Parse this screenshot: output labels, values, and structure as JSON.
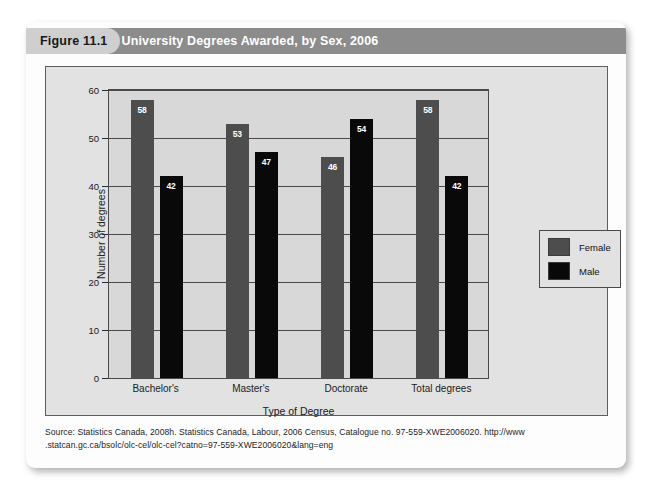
{
  "figure": {
    "number_label": "Figure 11.1",
    "title": "University Degrees Awarded, by Sex, 2006",
    "source_line_1": "Source: Statistics Canada, 2008h. Statistics Canada, Labour, 2006 Census, Catalogue no. 97-559-XWE2006020. http://www",
    "source_line_2": ".statcan.gc.ca/bsolc/olc-cel/olc-cel?catno=97-559-XWE2006020&lang=eng"
  },
  "colors": {
    "female": "#4d4d4d",
    "male": "#090909",
    "title_bar": "#8c8c8c",
    "number_tab": "#cfcfcf",
    "plot_background": "#d8d8d8",
    "panel_background": "#e2e2e2"
  },
  "chart_data": {
    "type": "bar",
    "title": "University Degrees Awarded, by Sex, 2006",
    "xlabel": "Type of Degree",
    "ylabel": "Number of degrees",
    "categories": [
      "Bachelor's",
      "Master's",
      "Doctorate",
      "Total degrees"
    ],
    "series": [
      {
        "name": "Female",
        "values": [
          58,
          53,
          46,
          58
        ],
        "color": "#4d4d4d"
      },
      {
        "name": "Male",
        "values": [
          42,
          47,
          54,
          42
        ],
        "color": "#090909"
      }
    ],
    "ylim": [
      0,
      60
    ],
    "yticks": [
      0,
      10,
      20,
      30,
      40,
      50,
      60
    ],
    "ytick_labels": [
      "0",
      "10",
      "20",
      "30",
      "40",
      "50",
      "60"
    ],
    "grid": true,
    "grid_axis": "y",
    "legend_position": "right-outside",
    "value_labels": true
  }
}
